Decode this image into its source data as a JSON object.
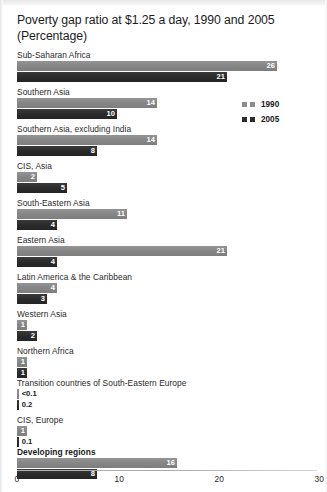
{
  "chart_data": {
    "type": "bar",
    "title": "Poverty gap ratio at $1.25 a day, 1990 and 2005",
    "subtitle": "(Percentage)",
    "xlabel": "",
    "ylabel": "",
    "xlim": [
      0,
      30
    ],
    "xticks": [
      "0",
      "10",
      "20",
      "30"
    ],
    "xtick_values": [
      0,
      10,
      20,
      30
    ],
    "grid": false,
    "orientation": "horizontal",
    "legend_position": "right-top",
    "legend": [
      {
        "name": "1990",
        "color": "#8c8c8c"
      },
      {
        "name": "2005",
        "color": "#2c2c2c"
      }
    ],
    "categories": [
      "Sub-Saharan Africa",
      "Southern Asia",
      "Southern Asia, excluding India",
      "CIS, Asia",
      "South-Eastern Asia",
      "Eastern Asia",
      "Latin America & the Caribbean",
      "Western Asia",
      "Northern Africa",
      "Transition countries of South-Eastern Europe",
      "CIS, Europe",
      "Developing regions"
    ],
    "series": [
      {
        "name": "1990",
        "values": [
          26,
          14,
          14,
          2,
          11,
          21,
          4,
          1,
          1,
          0.05,
          1,
          16
        ],
        "labels": [
          "26",
          "14",
          "14",
          "2",
          "11",
          "21",
          "4",
          "1",
          "1",
          "<0.1",
          "1",
          "16"
        ]
      },
      {
        "name": "2005",
        "values": [
          21,
          10,
          8,
          5,
          4,
          4,
          3,
          2,
          1,
          0.2,
          0.1,
          8
        ],
        "labels": [
          "21",
          "10",
          "8",
          "5",
          "4",
          "4",
          "3",
          "2",
          "1",
          "0.2",
          "0.1",
          "8"
        ]
      }
    ],
    "emphasized_categories": [
      "Developing regions"
    ]
  },
  "groups": [
    {
      "label": "Sub-Saharan Africa",
      "bold": false,
      "v1990": 26,
      "l1990": "26",
      "inside1990": true,
      "v2005": 21,
      "l2005": "21",
      "inside2005": true
    },
    {
      "label": "Southern Asia",
      "bold": false,
      "v1990": 14,
      "l1990": "14",
      "inside1990": true,
      "v2005": 10,
      "l2005": "10",
      "inside2005": true
    },
    {
      "label": "Southern Asia, excluding India",
      "bold": false,
      "v1990": 14,
      "l1990": "14",
      "inside1990": true,
      "v2005": 8,
      "l2005": "8",
      "inside2005": true
    },
    {
      "label": "CIS, Asia",
      "bold": false,
      "v1990": 2,
      "l1990": "2",
      "inside1990": true,
      "v2005": 5,
      "l2005": "5",
      "inside2005": true
    },
    {
      "label": "South-Eastern Asia",
      "bold": false,
      "v1990": 11,
      "l1990": "11",
      "inside1990": true,
      "v2005": 4,
      "l2005": "4",
      "inside2005": true
    },
    {
      "label": "Eastern Asia",
      "bold": false,
      "v1990": 21,
      "l1990": "21",
      "inside1990": true,
      "v2005": 4,
      "l2005": "4",
      "inside2005": true
    },
    {
      "label": "Latin America & the Caribbean",
      "bold": false,
      "v1990": 4,
      "l1990": "4",
      "inside1990": true,
      "v2005": 3,
      "l2005": "3",
      "inside2005": true
    },
    {
      "label": "Western Asia",
      "bold": false,
      "v1990": 1,
      "l1990": "1",
      "inside1990": true,
      "v2005": 2,
      "l2005": "2",
      "inside2005": true
    },
    {
      "label": "Northern Africa",
      "bold": false,
      "v1990": 1,
      "l1990": "1",
      "inside1990": true,
      "v2005": 1,
      "l2005": "1",
      "inside2005": true
    },
    {
      "label": "Transition countries of South-Eastern Europe",
      "bold": false,
      "v1990": 0,
      "l1990": "<0.1",
      "inside1990": false,
      "v2005": 0.2,
      "l2005": "0.2",
      "inside2005": false
    },
    {
      "label": "CIS, Europe",
      "bold": false,
      "v1990": 1,
      "l1990": "1",
      "inside1990": true,
      "v2005": 0.1,
      "l2005": "0.1",
      "inside2005": false
    },
    {
      "label": "Developing regions",
      "bold": true,
      "v1990": 16,
      "l1990": "16",
      "inside1990": true,
      "v2005": 8,
      "l2005": "8",
      "inside2005": true
    }
  ]
}
